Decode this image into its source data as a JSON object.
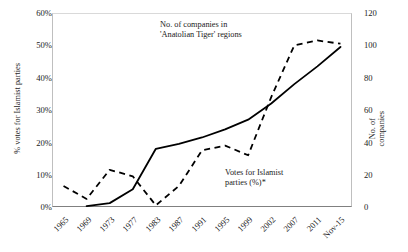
{
  "chart_data": {
    "type": "line",
    "title": "",
    "subtitle": "",
    "xlabel": "",
    "grid": false,
    "legend_position": "inline-annotations",
    "categories": [
      "1965",
      "1969",
      "1973",
      "1977",
      "1983",
      "1987",
      "1991",
      "1995",
      "1999",
      "2002",
      "2007",
      "2011",
      "Nov-15"
    ],
    "axes": {
      "left": {
        "label": "% votes for Islamist parties",
        "ticks": [
          "0%",
          "10%",
          "20%",
          "30%",
          "40%",
          "50%",
          "60%"
        ],
        "tick_values": [
          0,
          10,
          20,
          30,
          40,
          50,
          60
        ],
        "ylim": [
          0,
          60
        ]
      },
      "right": {
        "label_line1": "No. of",
        "label_line2": "companies",
        "label": "No. of companies",
        "ticks": [
          "0",
          "20",
          "40",
          "60",
          "80",
          "100",
          "120"
        ],
        "tick_values": [
          0,
          20,
          40,
          60,
          80,
          100,
          120
        ],
        "ylim": [
          0,
          120
        ]
      }
    },
    "series": [
      {
        "name": "Votes for Islamist parties (%)*",
        "axis": "left",
        "style": "solid",
        "color": "#000000",
        "x": [
          "1969",
          "1973",
          "1977",
          "1983",
          "1987",
          "1991",
          "1995",
          "1999",
          "2002",
          "2007",
          "2011",
          "Nov-15"
        ],
        "values": [
          0.3,
          1.2,
          5.5,
          18.0,
          19.5,
          21.5,
          24.0,
          27.0,
          32.0,
          38.0,
          43.5,
          49.5
        ]
      },
      {
        "name": "No. of companies in 'Anatolian Tiger' regions",
        "axis": "right",
        "style": "dashed",
        "color": "#000000",
        "x": [
          "1965",
          "1969",
          "1973",
          "1977",
          "1983",
          "1987",
          "1991",
          "1995",
          "1999",
          "2002",
          "2007",
          "2011",
          "Nov-15"
        ],
        "values": [
          13,
          5,
          23,
          19,
          1,
          13,
          35,
          38,
          32,
          68,
          100,
          103,
          101
        ]
      }
    ],
    "annotations": [
      {
        "name": "companies-annotation",
        "line1": "No. of companies in",
        "line2": "'Anatolian Tiger' regions"
      },
      {
        "name": "votes-annotation",
        "line1": "Votes for Islamist",
        "line2": "parties (%)*"
      }
    ]
  }
}
